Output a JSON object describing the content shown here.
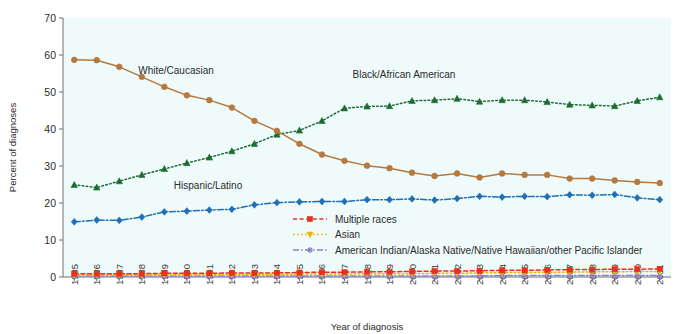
{
  "chart_data": {
    "type": "line",
    "title": "",
    "subtitle": "",
    "xlabel": "Year of diagnosis",
    "ylabel": "Percent of diagnoses",
    "ylim": [
      0,
      70
    ],
    "yticks": [
      0,
      10,
      20,
      30,
      40,
      50,
      60,
      70
    ],
    "grid": false,
    "legend_position": "inside-bottom-center",
    "plot_background": "#effafa",
    "x": [
      1985,
      1986,
      1987,
      1988,
      1989,
      1990,
      1991,
      1992,
      1993,
      1994,
      1995,
      1996,
      1997,
      1998,
      1999,
      2000,
      2001,
      2002,
      2003,
      2004,
      2005,
      2006,
      2007,
      2008,
      2009,
      2010,
      2011
    ],
    "categories": [
      "1985",
      "1986",
      "1987",
      "1988",
      "1989",
      "1990",
      "1991",
      "1992",
      "1993",
      "1994",
      "1995",
      "1996",
      "1997",
      "1998",
      "1999",
      "2000",
      "2001",
      "2002",
      "2003",
      "2004",
      "2005",
      "2006",
      "2007",
      "2008",
      "2009",
      "2010",
      "2011"
    ],
    "series": [
      {
        "name": "White/Caucasian",
        "color": "#b5793f",
        "marker": "circle",
        "line_style": "solid",
        "inline_label": "White/Caucasian",
        "values": [
          58.7,
          58.6,
          56.8,
          54.1,
          51.4,
          49.1,
          47.8,
          45.8,
          42.2,
          39.5,
          36.0,
          33.1,
          31.4,
          30.1,
          29.4,
          28.2,
          27.3,
          28.0,
          26.9,
          28.0,
          27.6,
          27.6,
          26.6,
          26.6,
          26.1,
          25.7,
          25.4
        ]
      },
      {
        "name": "Black/African American",
        "color": "#1d6b33",
        "marker": "triangle",
        "line_style": "dotted",
        "inline_label": "Black/African American",
        "values": [
          24.9,
          24.2,
          25.9,
          27.6,
          29.2,
          30.8,
          32.3,
          34.0,
          36.0,
          38.5,
          39.6,
          42.2,
          45.6,
          46.1,
          46.2,
          47.6,
          47.8,
          48.2,
          47.4,
          47.8,
          47.8,
          47.3,
          46.6,
          46.4,
          46.2,
          47.6,
          48.6
        ]
      },
      {
        "name": "Hispanic/Latino",
        "color": "#1f6fb4",
        "marker": "diamond",
        "line_style": "dashdot",
        "inline_label": "Hispanic/Latino",
        "values": [
          14.9,
          15.4,
          15.3,
          16.2,
          17.6,
          17.8,
          18.1,
          18.3,
          19.5,
          20.1,
          20.3,
          20.4,
          20.4,
          20.9,
          20.9,
          21.1,
          20.8,
          21.2,
          21.8,
          21.6,
          21.8,
          21.7,
          22.2,
          22.1,
          22.3,
          21.4,
          20.9
        ]
      },
      {
        "name": "Multiple races",
        "color": "#e8301c",
        "marker": "square",
        "line_style": "dashed",
        "inline_label": "",
        "values": [
          0.9,
          0.9,
          0.9,
          0.9,
          1.0,
          1.0,
          1.0,
          1.1,
          1.1,
          1.1,
          1.2,
          1.3,
          1.3,
          1.4,
          1.4,
          1.5,
          1.6,
          1.6,
          1.7,
          1.8,
          1.8,
          1.9,
          2.0,
          2.0,
          2.1,
          2.1,
          2.2
        ]
      },
      {
        "name": "Asian",
        "color": "#f0b400",
        "marker": "triangle-down",
        "line_style": "dotted",
        "inline_label": "",
        "values": [
          0.6,
          0.6,
          0.6,
          0.6,
          0.6,
          0.7,
          0.7,
          0.7,
          0.7,
          0.7,
          0.8,
          0.8,
          0.8,
          0.9,
          0.9,
          0.9,
          1.0,
          1.0,
          1.1,
          1.2,
          1.2,
          1.3,
          1.3,
          1.4,
          1.4,
          1.5,
          1.5
        ]
      },
      {
        "name": "American Indian/Alaska Native/Native Hawaiian/other Pacific Islander",
        "color": "#8f82c4",
        "marker": "asterisk",
        "line_style": "dashdot",
        "inline_label": "",
        "values": [
          0.3,
          0.3,
          0.3,
          0.3,
          0.3,
          0.3,
          0.3,
          0.3,
          0.3,
          0.3,
          0.3,
          0.3,
          0.3,
          0.3,
          0.3,
          0.3,
          0.3,
          0.3,
          0.3,
          0.4,
          0.4,
          0.4,
          0.4,
          0.4,
          0.4,
          0.4,
          0.4
        ]
      }
    ],
    "legend": [
      {
        "label": "Multiple races",
        "color": "#e8301c",
        "marker": "square",
        "line_style": "dashed"
      },
      {
        "label": "Asian",
        "color": "#f0b400",
        "marker": "triangle-down",
        "line_style": "dotted"
      },
      {
        "label": "American Indian/Alaska Native/Native Hawaiian/other Pacific Islander",
        "color": "#8f82c4",
        "marker": "asterisk",
        "line_style": "dashdot"
      }
    ],
    "annotations": [
      {
        "text": "White/Caucasian",
        "x_px": 176,
        "y_px": 74
      },
      {
        "text": "Black/African American",
        "x_px": 404,
        "y_px": 78
      },
      {
        "text": "Hispanic/Latino",
        "x_px": 208,
        "y_px": 189
      }
    ]
  }
}
